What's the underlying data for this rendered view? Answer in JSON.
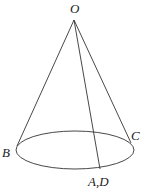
{
  "diagram": {
    "type": "cone",
    "labels": {
      "apex": "O",
      "left": "B",
      "right": "C",
      "bottom": "A,D"
    },
    "colors": {
      "stroke": "#333333",
      "text": "#222222",
      "background": "#ffffff"
    }
  }
}
